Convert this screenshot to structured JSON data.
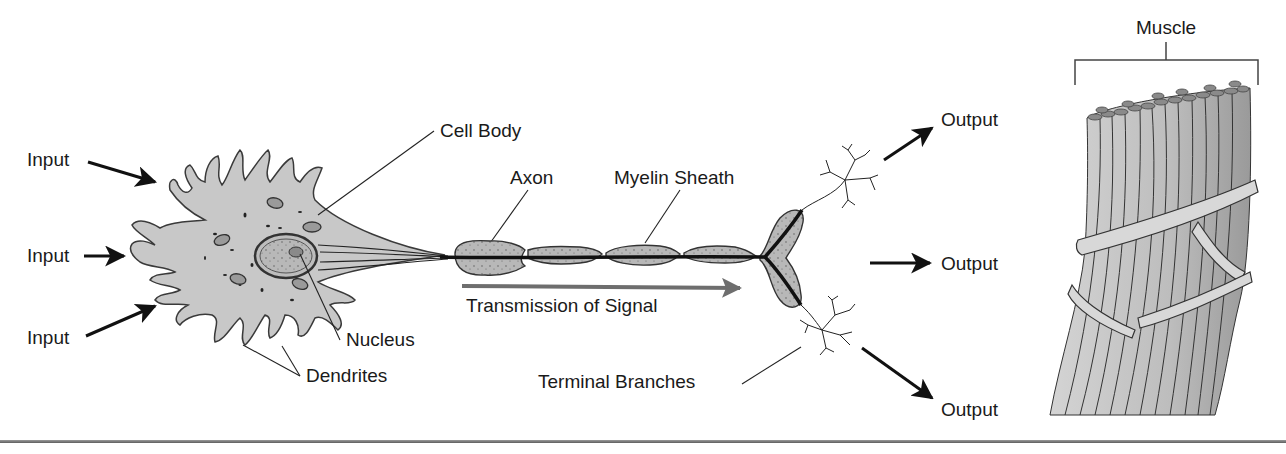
{
  "labels": {
    "inputs": [
      "Input",
      "Input",
      "Input"
    ],
    "outputs": [
      "Output",
      "Output",
      "Output"
    ],
    "cell_body": "Cell Body",
    "axon": "Axon",
    "myelin_sheath": "Myelin Sheath",
    "nucleus": "Nucleus",
    "dendrites": "Dendrites",
    "transmission": "Transmission of Signal",
    "terminal_branches": "Terminal Branches",
    "muscle": "Muscle"
  },
  "colors": {
    "cell_fill": "#c8c8c8",
    "cell_stroke": "#3a3a3a",
    "myelin_fill": "#b0b0b0",
    "axon_line": "#111111",
    "transmission_arrow": "#6e6e6e",
    "muscle_fill": "#c4c4c4",
    "muscle_cap": "#8a8a8a",
    "text": "#1a1a1a",
    "bottom_rule": "#6a6a6a"
  }
}
